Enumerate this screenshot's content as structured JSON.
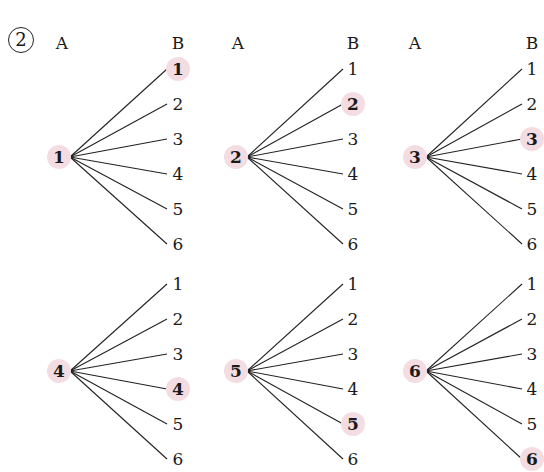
{
  "problem_number": "2",
  "header_labels": {
    "a": "A",
    "b": "B"
  },
  "highlight_color": "#f3dde2",
  "trees": [
    {
      "a_value": "1",
      "b_values": [
        "1",
        "2",
        "3",
        "4",
        "5",
        "6"
      ],
      "highlighted_b": "1"
    },
    {
      "a_value": "2",
      "b_values": [
        "1",
        "2",
        "3",
        "4",
        "5",
        "6"
      ],
      "highlighted_b": "2"
    },
    {
      "a_value": "3",
      "b_values": [
        "1",
        "2",
        "3",
        "4",
        "5",
        "6"
      ],
      "highlighted_b": "3"
    },
    {
      "a_value": "4",
      "b_values": [
        "1",
        "2",
        "3",
        "4",
        "5",
        "6"
      ],
      "highlighted_b": "4"
    },
    {
      "a_value": "5",
      "b_values": [
        "1",
        "2",
        "3",
        "4",
        "5",
        "6"
      ],
      "highlighted_b": "5"
    },
    {
      "a_value": "6",
      "b_values": [
        "1",
        "2",
        "3",
        "4",
        "5",
        "6"
      ],
      "highlighted_b": "6"
    }
  ]
}
